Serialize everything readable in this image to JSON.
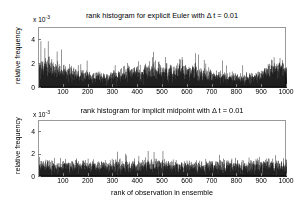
{
  "figure": {
    "width": 298,
    "height": 209,
    "background": "#ffffff",
    "bar_color": "#000000",
    "axis_color": "#9a9a9a"
  },
  "chart_data": [
    {
      "type": "bar",
      "id": "explicit-euler",
      "title": "rank histogram for explicit Euler with Δ t = 0.01",
      "xlabel": "",
      "ylabel": "relative frequency",
      "y_exponent_label": "x 10",
      "y_exponent_sup": "-3",
      "xlim": [
        0,
        1000
      ],
      "ylim": [
        0,
        5
      ],
      "y_scale": 0.001,
      "xticks": [
        100,
        200,
        300,
        400,
        500,
        600,
        700,
        800,
        900,
        1000
      ],
      "xticklabels": [
        "100",
        "200",
        "300",
        "400",
        "500",
        "600",
        "700",
        "800",
        "900",
        "1000"
      ],
      "yticks": [
        0,
        2,
        4
      ],
      "yticklabels": [
        "0",
        "2",
        "4"
      ],
      "grid": false,
      "legend": "none",
      "n_bins": 1000,
      "seed": 20110,
      "shape": "u-shaped",
      "note": "elevated near rank 1-120 and rank 900-1000, dip near rank 150-300, mid region moderately elevated with spikes to ~3.8e-3",
      "envelope_x": [
        1,
        30,
        60,
        100,
        140,
        180,
        220,
        260,
        300,
        340,
        380,
        420,
        460,
        500,
        540,
        580,
        620,
        660,
        700,
        740,
        780,
        820,
        860,
        900,
        940,
        970,
        1000
      ],
      "envelope_mean": [
        1.95,
        1.85,
        1.65,
        1.45,
        1.2,
        1.0,
        0.9,
        0.88,
        0.95,
        1.2,
        1.35,
        1.45,
        1.4,
        1.45,
        1.35,
        1.4,
        1.3,
        1.15,
        1.05,
        0.92,
        0.85,
        0.8,
        0.85,
        1.1,
        1.7,
        1.8,
        1.55
      ],
      "envelope_spread": [
        0.85,
        0.8,
        0.7,
        0.62,
        0.52,
        0.45,
        0.42,
        0.42,
        0.46,
        0.55,
        0.6,
        0.66,
        0.62,
        0.7,
        0.62,
        0.64,
        0.6,
        0.55,
        0.5,
        0.45,
        0.42,
        0.4,
        0.42,
        0.52,
        0.72,
        0.78,
        0.7
      ],
      "max_value": 3.9
    },
    {
      "type": "bar",
      "id": "implicit-midpoint",
      "title": "rank histogram for implicit midpoint with Δ t = 0.01",
      "xlabel": "rank of observation in ensemble",
      "ylabel": "relative frequency",
      "y_exponent_label": "x 10",
      "y_exponent_sup": "-3",
      "xlim": [
        0,
        1000
      ],
      "ylim": [
        0,
        5
      ],
      "y_scale": 0.001,
      "xticks": [
        100,
        200,
        300,
        400,
        500,
        600,
        700,
        800,
        900,
        1000
      ],
      "xticklabels": [
        "100",
        "200",
        "300",
        "400",
        "500",
        "600",
        "700",
        "800",
        "900",
        "1000"
      ],
      "yticks": [
        0,
        2,
        4
      ],
      "yticklabels": [
        "0",
        "2",
        "4"
      ],
      "grid": false,
      "legend": "none",
      "n_bins": 1000,
      "seed": 48371,
      "shape": "flat",
      "note": "approximately uniform around 1.0e-3 with noise spikes up to ~3.0e-3",
      "envelope_x": [
        1,
        50,
        100,
        150,
        200,
        250,
        300,
        350,
        400,
        450,
        500,
        550,
        600,
        650,
        700,
        750,
        800,
        850,
        900,
        950,
        1000
      ],
      "envelope_mean": [
        1.05,
        1.0,
        1.0,
        1.02,
        1.05,
        1.0,
        1.0,
        0.98,
        1.0,
        1.02,
        1.05,
        1.0,
        0.98,
        1.0,
        1.0,
        1.0,
        1.02,
        1.0,
        1.0,
        1.02,
        1.05
      ],
      "envelope_spread": [
        0.55,
        0.5,
        0.5,
        0.52,
        0.55,
        0.5,
        0.5,
        0.48,
        0.5,
        0.52,
        0.58,
        0.52,
        0.48,
        0.5,
        0.5,
        0.5,
        0.52,
        0.5,
        0.5,
        0.52,
        0.55
      ],
      "max_value": 3.0
    }
  ]
}
